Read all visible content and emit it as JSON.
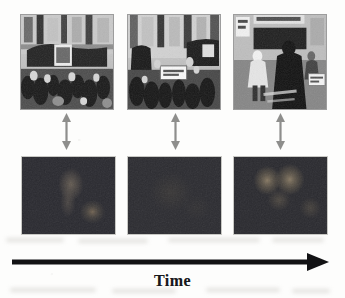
{
  "figure": {
    "background_color": "#fdfdfc"
  },
  "top_row": {
    "row_label": "Input video frames",
    "frames": [
      {
        "id": "frame-1",
        "alt": "Grayscale street scene: crowd of people in front of building facade with dark vehicle",
        "time_index": 1
      },
      {
        "id": "frame-2",
        "alt": "Grayscale street scene: crowd with a light banner or sign held in the middle",
        "time_index": 2
      },
      {
        "id": "frame-3",
        "alt": "Grayscale street scene: pedestrians walking past a shopfront, dark figure at right",
        "time_index": 3
      }
    ]
  },
  "connectors": {
    "icon": "double-headed-vertical-arrow",
    "color": "#8e8e8c",
    "count": 3,
    "label": "corresponds to"
  },
  "bottom_row": {
    "row_label": "Attention / saliency maps",
    "maps": [
      {
        "id": "map-1",
        "alt": "Dark attention map with faint warm blob at centre-right and a rounder blob lower right",
        "base_color": "#2a2a30",
        "time_index": 1
      },
      {
        "id": "map-2",
        "alt": "Dark attention map with no strong response, nearly uniform",
        "base_color": "#2c2c31",
        "time_index": 2
      },
      {
        "id": "map-3",
        "alt": "Dark attention map with two bright rounded blobs in the upper half",
        "base_color": "#2a2a2f",
        "time_index": 3
      }
    ]
  },
  "axis": {
    "label": "Time",
    "direction": "left-to-right",
    "arrow_color": "#121214",
    "icon": "right-arrow-icon"
  }
}
